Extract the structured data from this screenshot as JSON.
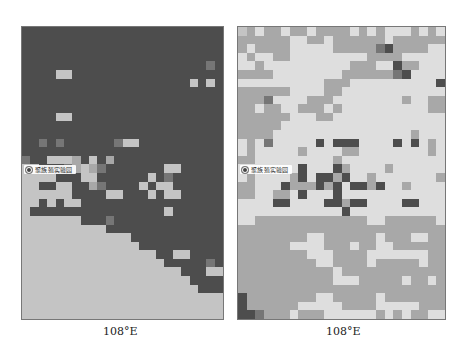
{
  "figure": {
    "palette": {
      "0": "#4d4d4d",
      "1": "#767676",
      "2": "#a8a8a8",
      "3": "#c4c4c4",
      "4": "#dedede"
    },
    "panels": [
      {
        "id": "left",
        "x_tick_label": "108°E",
        "station_label": "聚族殖实验园",
        "station_marker": "station-marker",
        "cols": 24,
        "rows": 34,
        "cells": [
          "000000000000000000000000",
          "000000000000000000000000",
          "000000000000000000000000",
          "000000000000000000000000",
          "000000000000000000000010",
          "000033000000000000000000",
          "000000000000000000003030",
          "000000000000000000000000",
          "000000000000000000000000",
          "000000000000000000000000",
          "000033000000000000000000",
          "000000000000000000000000",
          "000000000000000000000000",
          "001010000001330000000000",
          "000000000000000000000000",
          "100333203020000000000000",
          "330001232100000003300000",
          "333300033000000301000000",
          "330033002100003033000000",
          "333333000033000303300000",
          "330303300000000000000000",
          "300000000000000003000000",
          "333333300010000000000000",
          "333333333300000000000000",
          "333333333333300000000000",
          "333333333333330000000000",
          "333333333333333300330000",
          "333333333333333330000010",
          "333333333333333333300033",
          "333333333333333333330000",
          "333333333333333333333000",
          "333333333333333333333333",
          "333333333333333333333333",
          "333333333333333333333333"
        ]
      },
      {
        "id": "right",
        "x_tick_label": "108°E",
        "station_label": "聚族殖实验园",
        "station_marker": "station-marker",
        "cols": 24,
        "rows": 34,
        "cells": [
          "324224224222242424442424",
          "222222442242222224222222",
          "242222444442222210222244",
          "424422444444444222244444",
          "442444444444422244022444",
          "222244444444222222104444",
          "444444444422244444444440",
          "222222444422444444444444",
          "222144442224444444424422",
          "224224422242444444444422",
          "222222444224444444444444",
          "222224444444444444444444",
          "222244444444444444442444",
          "424144444040004444040424",
          "424444424444224444444424",
          "224444444442444444444444",
          "444444404440244442444444",
          "424444204002044244444442",
          "224440222020400204424444",
          "224422404440444444444444",
          "444400444400200444400444",
          "444444444444044444444444",
          "442222222222222442222224",
          "222222222222222222222222",
          "222222224422222242224422",
          "222222444422242244222222",
          "222222224442222444444422",
          "222222222442222422222422",
          "222222222224222222222222",
          "222222222224442222242242",
          "222222222222222222222222",
          "022222222442222242222222",
          "022222244444222244444222",
          "001222422244444424242244"
        ]
      }
    ]
  }
}
